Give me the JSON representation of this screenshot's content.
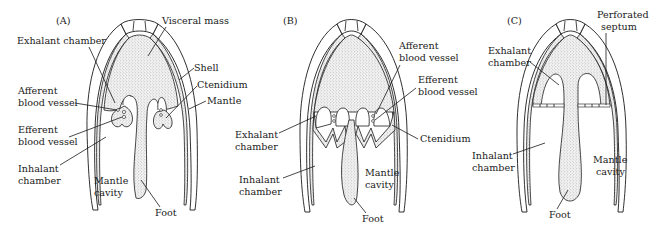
{
  "figure": {
    "panels": [
      {
        "id": "A",
        "tag": "(A)",
        "labels": {
          "visceral_mass": "Visceral mass",
          "exhalant_chamber": "Exhalant chamber",
          "shell": "Shell",
          "ctenidium": "Ctenidium",
          "afferent_1": "Afferent",
          "afferent_2": "blood vessel",
          "mantle": "Mantle",
          "efferent_1": "Efferent",
          "efferent_2": "blood vessel",
          "inhalant_1": "Inhalant",
          "inhalant_2": "chamber",
          "mantle_cavity_1": "Mantle",
          "mantle_cavity_2": "cavity",
          "foot": "Foot"
        }
      },
      {
        "id": "B",
        "tag": "(B)",
        "labels": {
          "afferent_1": "Afferent",
          "afferent_2": "blood vessel",
          "efferent_1": "Efferent",
          "efferent_2": "blood vessel",
          "exhalant_1": "Exhalant",
          "exhalant_2": "chamber",
          "ctenidium": "Ctenidium",
          "inhalant_1": "Inhalant",
          "inhalant_2": "chamber",
          "mantle_cavity_1": "Mantle",
          "mantle_cavity_2": "cavity",
          "foot": "Foot"
        }
      },
      {
        "id": "C",
        "tag": "(C)",
        "labels": {
          "perforated_1": "Perforated",
          "perforated_2": "septum",
          "exhalant_1": "Exhalant",
          "exhalant_2": "chamber",
          "inhalant_1": "Inhalant",
          "inhalant_2": "chamber",
          "mantle_cavity_1": "Mantle",
          "mantle_cavity_2": "cavity",
          "foot": "Foot"
        }
      }
    ]
  }
}
